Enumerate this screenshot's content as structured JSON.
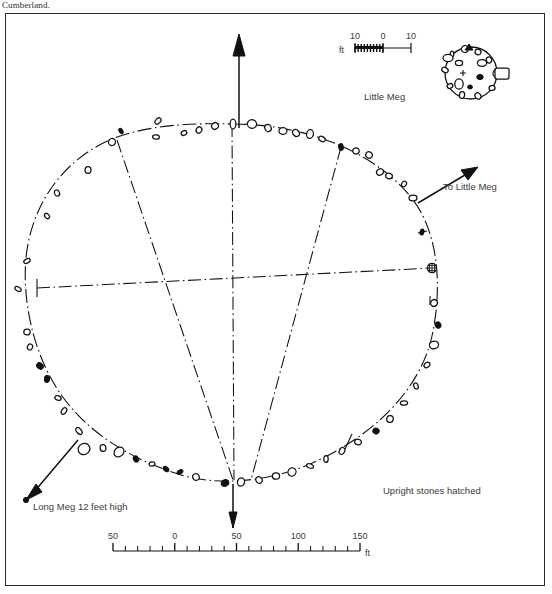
{
  "caption": {
    "top_text": "Cumberland."
  },
  "figure": {
    "inset_label": "Little Meg",
    "direction_label": "To Little Meg",
    "long_meg_label": "Long Meg 12 feet high",
    "legend_note": "Upright stones hatched"
  },
  "scale_main": {
    "unit": "ft",
    "tick_labels": [
      "50",
      "0",
      "50",
      "100",
      "150"
    ],
    "tick_values": [
      -50,
      0,
      50,
      100,
      150
    ],
    "minor_interval": 10,
    "major_interval": 50
  },
  "scale_inset": {
    "unit": "ft",
    "tick_labels": [
      "10",
      "0",
      "10"
    ],
    "tick_values": [
      -10,
      0,
      10
    ]
  },
  "colors": {
    "ink": "#111111",
    "label_ink": "#3a3a3a",
    "frame": "#2a2a2a",
    "paper": "#ffffff"
  },
  "chart_data": {
    "type": "scatter",
    "xlabel": "ft",
    "ylabel": "",
    "grid": false,
    "legend_position": "bottom-right",
    "annotations": [
      "Little Meg",
      "To Little Meg",
      "Long Meg 12 feet high",
      "Upright stones hatched",
      "ft"
    ],
    "series": [
      {
        "name": "ring-stones",
        "note": "Stones of the main egg-shaped circle; open = fallen, filled/hatched = upright",
        "points": [
          {
            "x": 233,
            "y": 124,
            "r": 5.0,
            "fill": "open"
          },
          {
            "x": 215,
            "y": 126,
            "r": 3.4,
            "fill": "open"
          },
          {
            "x": 252,
            "y": 124,
            "r": 4.6,
            "fill": "open"
          },
          {
            "x": 268,
            "y": 128,
            "r": 3.6,
            "fill": "open"
          },
          {
            "x": 199,
            "y": 130,
            "r": 3.2,
            "fill": "open"
          },
          {
            "x": 283,
            "y": 131,
            "r": 4.0,
            "fill": "open"
          },
          {
            "x": 296,
            "y": 133,
            "r": 3.8,
            "fill": "open"
          },
          {
            "x": 310,
            "y": 134,
            "r": 4.4,
            "fill": "open"
          },
          {
            "x": 184,
            "y": 133,
            "r": 3.0,
            "fill": "open"
          },
          {
            "x": 322,
            "y": 139,
            "r": 3.4,
            "fill": "open"
          },
          {
            "x": 341,
            "y": 147,
            "r": 3.4,
            "fill": "filled"
          },
          {
            "x": 158,
            "y": 121,
            "r": 3.6,
            "fill": "open"
          },
          {
            "x": 156,
            "y": 137,
            "r": 3.4,
            "fill": "open"
          },
          {
            "x": 121,
            "y": 131,
            "r": 3.0,
            "fill": "filled"
          },
          {
            "x": 112,
            "y": 142,
            "r": 3.6,
            "fill": "open"
          },
          {
            "x": 356,
            "y": 151,
            "r": 3.2,
            "fill": "open"
          },
          {
            "x": 369,
            "y": 155,
            "r": 3.4,
            "fill": "open"
          },
          {
            "x": 88,
            "y": 170,
            "r": 3.4,
            "fill": "open"
          },
          {
            "x": 380,
            "y": 172,
            "r": 3.6,
            "fill": "open"
          },
          {
            "x": 389,
            "y": 176,
            "r": 3.4,
            "fill": "open"
          },
          {
            "x": 57,
            "y": 193,
            "r": 3.2,
            "fill": "open"
          },
          {
            "x": 404,
            "y": 184,
            "r": 3.0,
            "fill": "open"
          },
          {
            "x": 413,
            "y": 198,
            "r": 4.0,
            "fill": "open"
          },
          {
            "x": 47,
            "y": 216,
            "r": 3.0,
            "fill": "open"
          },
          {
            "x": 422,
            "y": 232,
            "r": 3.0,
            "fill": "filled"
          },
          {
            "x": 27,
            "y": 261,
            "r": 3.4,
            "fill": "open"
          },
          {
            "x": 18,
            "y": 289,
            "r": 3.4,
            "fill": "open"
          },
          {
            "x": 432,
            "y": 268,
            "r": 4.6,
            "fill": "hatched"
          },
          {
            "x": 434,
            "y": 303,
            "r": 3.4,
            "fill": "open"
          },
          {
            "x": 27,
            "y": 332,
            "r": 3.2,
            "fill": "open"
          },
          {
            "x": 438,
            "y": 325,
            "r": 3.2,
            "fill": "filled"
          },
          {
            "x": 30,
            "y": 347,
            "r": 3.0,
            "fill": "open"
          },
          {
            "x": 434,
            "y": 345,
            "r": 4.6,
            "fill": "open"
          },
          {
            "x": 40,
            "y": 366,
            "r": 3.6,
            "fill": "filled"
          },
          {
            "x": 47,
            "y": 379,
            "r": 3.4,
            "fill": "filled"
          },
          {
            "x": 427,
            "y": 365,
            "r": 3.2,
            "fill": "open"
          },
          {
            "x": 58,
            "y": 398,
            "r": 3.2,
            "fill": "open"
          },
          {
            "x": 416,
            "y": 386,
            "r": 3.2,
            "fill": "open"
          },
          {
            "x": 64,
            "y": 411,
            "r": 3.6,
            "fill": "open"
          },
          {
            "x": 404,
            "y": 403,
            "r": 3.6,
            "fill": "open"
          },
          {
            "x": 79,
            "y": 431,
            "r": 4.0,
            "fill": "open"
          },
          {
            "x": 390,
            "y": 419,
            "r": 3.4,
            "fill": "open"
          },
          {
            "x": 84,
            "y": 449,
            "r": 6.0,
            "fill": "open"
          },
          {
            "x": 376,
            "y": 431,
            "r": 3.2,
            "fill": "filled"
          },
          {
            "x": 103,
            "y": 448,
            "r": 3.4,
            "fill": "open"
          },
          {
            "x": 119,
            "y": 452,
            "r": 5.4,
            "fill": "open"
          },
          {
            "x": 358,
            "y": 442,
            "r": 3.4,
            "fill": "open"
          },
          {
            "x": 136,
            "y": 459,
            "r": 3.2,
            "fill": "filled"
          },
          {
            "x": 342,
            "y": 451,
            "r": 3.6,
            "fill": "open"
          },
          {
            "x": 152,
            "y": 464,
            "r": 3.0,
            "fill": "open"
          },
          {
            "x": 166,
            "y": 469,
            "r": 3.2,
            "fill": "filled"
          },
          {
            "x": 326,
            "y": 459,
            "r": 3.4,
            "fill": "open"
          },
          {
            "x": 180,
            "y": 472,
            "r": 3.2,
            "fill": "filled"
          },
          {
            "x": 310,
            "y": 466,
            "r": 3.6,
            "fill": "open"
          },
          {
            "x": 196,
            "y": 477,
            "r": 3.4,
            "fill": "open"
          },
          {
            "x": 292,
            "y": 472,
            "r": 4.2,
            "fill": "open"
          },
          {
            "x": 276,
            "y": 476,
            "r": 3.6,
            "fill": "open"
          },
          {
            "x": 259,
            "y": 480,
            "r": 3.4,
            "fill": "open"
          },
          {
            "x": 241,
            "y": 482,
            "r": 4.2,
            "fill": "open"
          },
          {
            "x": 225,
            "y": 483,
            "r": 4.0,
            "fill": "filled"
          }
        ]
      },
      {
        "name": "inset-little-meg-stones",
        "note": "Stones of the Little Meg inset circle",
        "points": [
          {
            "x": 452,
            "y": 54,
            "r": 3.0,
            "fill": "open"
          },
          {
            "x": 465,
            "y": 49,
            "r": 3.6,
            "fill": "open"
          },
          {
            "x": 478,
            "y": 52,
            "r": 3.0,
            "fill": "open"
          },
          {
            "x": 489,
            "y": 60,
            "r": 3.0,
            "fill": "open"
          },
          {
            "x": 497,
            "y": 73,
            "r": 4.4,
            "fill": "open"
          },
          {
            "x": 492,
            "y": 88,
            "r": 3.0,
            "fill": "open"
          },
          {
            "x": 478,
            "y": 96,
            "r": 3.4,
            "fill": "open"
          },
          {
            "x": 462,
            "y": 95,
            "r": 3.4,
            "fill": "open"
          },
          {
            "x": 450,
            "y": 86,
            "r": 3.0,
            "fill": "open"
          },
          {
            "x": 445,
            "y": 70,
            "r": 3.4,
            "fill": "open"
          }
        ]
      }
    ]
  }
}
